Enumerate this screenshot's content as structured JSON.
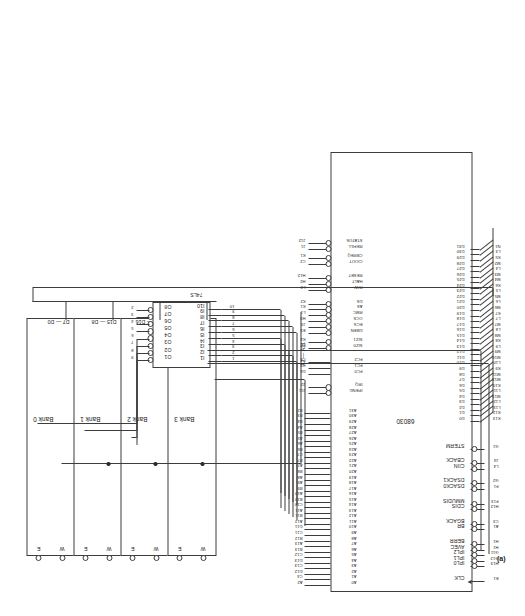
{
  "figure": {
    "caption": "(a)",
    "cpu_name": "68030",
    "decoder_name": "74LS",
    "address_bus_label": "A2 — A31"
  },
  "memory": {
    "banks": [
      {
        "name": "Bank 0",
        "data_label": "D7 — D0",
        "pins": [
          "E",
          "W"
        ]
      },
      {
        "name": "Bank 1",
        "data_label": "D15 — D8",
        "pins": [
          "E",
          "W"
        ]
      },
      {
        "name": "Bank 2",
        "data_label": "D23 — D16",
        "pins": [
          "E",
          "W"
        ]
      },
      {
        "name": "Bank 3",
        "data_label": "D31 — D24",
        "pins": [
          "E",
          "W"
        ]
      }
    ],
    "ack_pins": [
      "DSACK0",
      "DSACK1"
    ]
  },
  "decoder": {
    "name": "74LS",
    "outputs": [
      "O1",
      "O2",
      "O3",
      "O4",
      "O5",
      "O6",
      "O7",
      "O8"
    ],
    "output_pins": [
      "9",
      "8",
      "7",
      "6",
      "5",
      "4",
      "3",
      "2"
    ],
    "inputs": [
      "I1",
      "I2",
      "I3",
      "I4",
      "I5",
      "I6",
      "I7",
      "I8",
      "I9",
      "I10"
    ],
    "input_pins": [
      "1",
      "2",
      "3",
      "4",
      "5",
      "6",
      "7",
      "8",
      "9",
      "10"
    ]
  },
  "cpu": {
    "name": "68030",
    "address_pins": [
      {
        "label": "A0",
        "pin": "A2"
      },
      {
        "label": "A1",
        "pin": "C4"
      },
      {
        "label": "A2",
        "pin": "D12"
      },
      {
        "label": "A3",
        "pin": "C13"
      },
      {
        "label": "A4",
        "pin": "D13"
      },
      {
        "label": "A5",
        "pin": "C12"
      },
      {
        "label": "A6",
        "pin": "B13"
      },
      {
        "label": "A7",
        "pin": "A13"
      },
      {
        "label": "A8",
        "pin": "B12"
      },
      {
        "label": "A9",
        "pin": "C11"
      },
      {
        "label": "A10",
        "pin": "D11"
      },
      {
        "label": "A11",
        "pin": "A12"
      },
      {
        "label": "A12",
        "pin": "B11"
      },
      {
        "label": "A13",
        "pin": "A11"
      },
      {
        "label": "A14",
        "pin": "C10"
      },
      {
        "label": "A15",
        "pin": "B10"
      },
      {
        "label": "A16",
        "pin": "A10"
      },
      {
        "label": "A17",
        "pin": "B9"
      },
      {
        "label": "A18",
        "pin": "A9"
      },
      {
        "label": "A19",
        "pin": "A8"
      },
      {
        "label": "A20",
        "pin": "B8"
      },
      {
        "label": "A21",
        "pin": "A7"
      },
      {
        "label": "A22",
        "pin": "B7"
      },
      {
        "label": "A23",
        "pin": "C7"
      },
      {
        "label": "A24",
        "pin": "B6"
      },
      {
        "label": "A25",
        "pin": "A6"
      },
      {
        "label": "A26",
        "pin": "A5"
      },
      {
        "label": "A27",
        "pin": "B5"
      },
      {
        "label": "A28",
        "pin": "A4"
      },
      {
        "label": "A29",
        "pin": "B4"
      },
      {
        "label": "A30",
        "pin": "B3"
      },
      {
        "label": "A31",
        "pin": "B2"
      }
    ],
    "top_right_pins": [
      {
        "label": "IPEND",
        "pin": "J11",
        "bubble": true
      },
      {
        "label": "IRQ",
        "pin": "J2",
        "bubble": true
      },
      {
        "label": "FC0",
        "pin": "D6",
        "bubble": false
      },
      {
        "label": "FC1",
        "pin": "C5",
        "bubble": false
      },
      {
        "label": "FC2",
        "pin": "C6",
        "bubble": false
      },
      {
        "label": "SIZ0",
        "pin": "L2",
        "bubble": true
      },
      {
        "label": "SIZ1",
        "pin": "K4",
        "bubble": true
      },
      {
        "label": "DBEN",
        "pin": "E3",
        "bubble": true
      },
      {
        "label": "ECS",
        "pin": "J3",
        "bubble": true
      },
      {
        "label": "OCS",
        "pin": "H3",
        "bubble": true
      },
      {
        "label": "RMC",
        "pin": "L1",
        "bubble": true
      },
      {
        "label": "AS",
        "pin": "K1",
        "bubble": true
      },
      {
        "label": "DS",
        "pin": "K2",
        "bubble": true
      },
      {
        "label": "R/W",
        "pin": "L3",
        "bubble": true
      },
      {
        "label": "HALT",
        "pin": "H2",
        "bubble": true
      },
      {
        "label": "RESET",
        "pin": "H12",
        "bubble": true
      },
      {
        "label": "CIOUT",
        "pin": "C2",
        "bubble": true
      },
      {
        "label": "CBREQ",
        "pin": "K1",
        "bubble": true
      },
      {
        "label": "REFILL",
        "pin": "J1",
        "bubble": true
      },
      {
        "label": "STATUS",
        "pin": "J12",
        "bubble": true
      }
    ],
    "left_pins": [
      {
        "label": "CLK",
        "pin": "E1",
        "arrow": true
      },
      {
        "label": "IPL0",
        "pin": "H13",
        "bubble": true
      },
      {
        "label": "IPL1",
        "pin": "G12",
        "bubble": true
      },
      {
        "label": "IPL2",
        "pin": "G11",
        "bubble": true
      },
      {
        "label": "AVEC",
        "pin": "H1",
        "bubble": true
      },
      {
        "label": "BERR",
        "pin": "H1",
        "bubble": true
      },
      {
        "label": "BR",
        "pin": "A1",
        "bubble": true
      },
      {
        "label": "BGACK",
        "pin": "C3",
        "bubble": true
      },
      {
        "label": "CDIS",
        "pin": "H12",
        "bubble": true
      },
      {
        "label": "MMUDIS",
        "pin": "F13",
        "bubble": true
      },
      {
        "label": "DSACK0",
        "pin": "F1",
        "bubble": true
      },
      {
        "label": "DSACK1",
        "pin": "G2",
        "bubble": true
      },
      {
        "label": "CIIN",
        "pin": "L4",
        "bubble": true
      },
      {
        "label": "CBACK",
        "pin": "J4",
        "bubble": true
      },
      {
        "label": "STERM",
        "pin": "G1",
        "bubble": true
      }
    ],
    "data_pins": [
      {
        "label": "D0",
        "pin": "K13"
      },
      {
        "label": "D1",
        "pin": "K12"
      },
      {
        "label": "D2",
        "pin": "L13"
      },
      {
        "label": "D3",
        "pin": "L12"
      },
      {
        "label": "D4",
        "pin": "M13"
      },
      {
        "label": "D5",
        "pin": "L11"
      },
      {
        "label": "D6",
        "pin": "K10"
      },
      {
        "label": "D7",
        "pin": "M12"
      },
      {
        "label": "D8",
        "pin": "M11"
      },
      {
        "label": "D9",
        "pin": "K9"
      },
      {
        "label": "D10",
        "pin": "L10"
      },
      {
        "label": "D11",
        "pin": "M10"
      },
      {
        "label": "D12",
        "pin": "M9"
      },
      {
        "label": "D13",
        "pin": "L9"
      },
      {
        "label": "D14",
        "pin": "K8"
      },
      {
        "label": "D15",
        "pin": "M8"
      },
      {
        "label": "D16",
        "pin": "L8"
      },
      {
        "label": "D17",
        "pin": "M7"
      },
      {
        "label": "D18",
        "pin": "L7"
      },
      {
        "label": "D19",
        "pin": "K7"
      },
      {
        "label": "D20",
        "pin": "M6"
      },
      {
        "label": "D21",
        "pin": "L6"
      },
      {
        "label": "D22",
        "pin": "M5"
      },
      {
        "label": "D23",
        "pin": "L5"
      },
      {
        "label": "D24",
        "pin": "K6"
      },
      {
        "label": "D25",
        "pin": "M4"
      },
      {
        "label": "D26",
        "pin": "M3"
      },
      {
        "label": "D27",
        "pin": "L4"
      },
      {
        "label": "D28",
        "pin": "M2"
      },
      {
        "label": "D29",
        "pin": "K5"
      },
      {
        "label": "D30",
        "pin": "L3"
      },
      {
        "label": "D31",
        "pin": "N1"
      }
    ]
  }
}
